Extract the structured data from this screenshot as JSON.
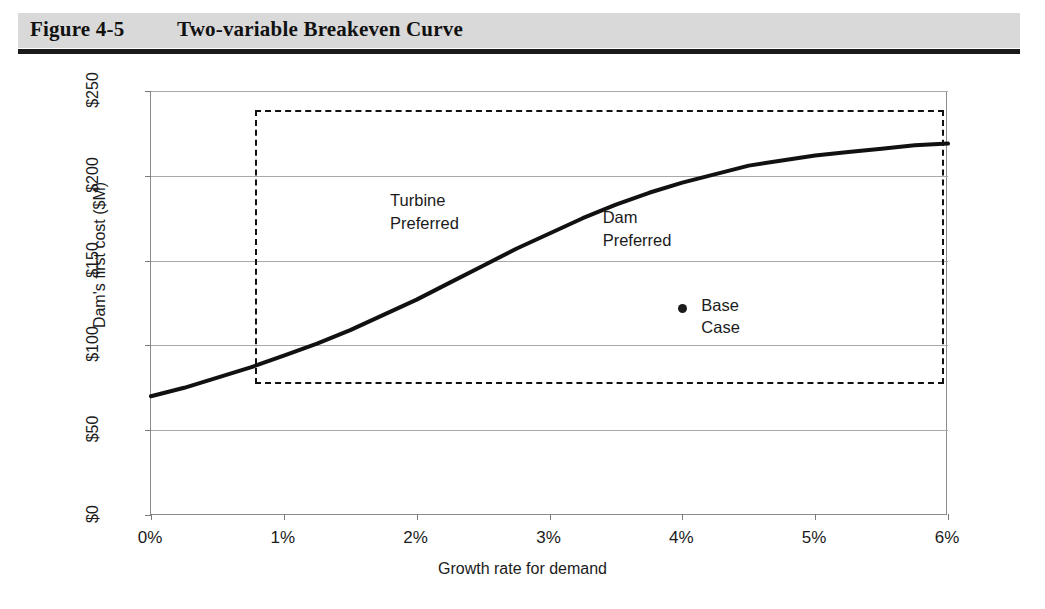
{
  "figure": {
    "number": "Figure 4-5",
    "title": "Two-variable Breakeven Curve",
    "header_bg": "#d9d9d9",
    "rule_color": "#1a1a1a"
  },
  "annotations": {
    "turbine_region": "Turbine\nPreferred",
    "dam_region": "Dam\nPreferred",
    "base_case": "Base\nCase"
  },
  "chart_data": {
    "type": "line",
    "title": "Two-variable Breakeven Curve",
    "xlabel": "Growth rate for demand",
    "ylabel": "Dam's first cost ($M)",
    "xlim": [
      0,
      6
    ],
    "ylim": [
      0,
      250
    ],
    "grid": true,
    "legend": "none",
    "x_ticks": [
      0,
      1,
      2,
      3,
      4,
      5,
      6
    ],
    "x_ticklabels": [
      "0%",
      "1%",
      "2%",
      "3%",
      "4%",
      "5%",
      "6%"
    ],
    "y_ticks": [
      0,
      50,
      100,
      150,
      200,
      250
    ],
    "y_ticklabels": [
      "$0",
      "$50",
      "$100",
      "$150",
      "$200",
      "$250"
    ],
    "series": [
      {
        "name": "Breakeven curve",
        "color": "#111111",
        "linewidth": 4,
        "x": [
          0,
          0.25,
          0.5,
          0.75,
          1.0,
          1.25,
          1.5,
          1.75,
          2.0,
          2.25,
          2.5,
          2.75,
          3.0,
          3.25,
          3.5,
          3.75,
          4.0,
          4.25,
          4.5,
          4.75,
          5.0,
          5.25,
          5.5,
          5.75,
          6.0
        ],
        "y": [
          70,
          75,
          81,
          87,
          94,
          101,
          109,
          118,
          127,
          137,
          147,
          157,
          166,
          175,
          183,
          190,
          196,
          201,
          206,
          209,
          212,
          214,
          216,
          218,
          219
        ]
      }
    ],
    "points": [
      {
        "name": "Base Case",
        "x": 4.0,
        "y": 122,
        "marker": "circle",
        "color": "#1b1b1b",
        "label": "Base\nCase"
      }
    ],
    "regions": [
      {
        "name": "Turbine Preferred",
        "label_x": 1.8,
        "label_y": 192,
        "description": "above/left of the breakeven curve"
      },
      {
        "name": "Dam Preferred",
        "label_x": 3.4,
        "label_y": 182,
        "description": "below/right of the breakeven curve"
      }
    ],
    "shapes": [
      {
        "name": "sensitivity-range-box",
        "type": "rect",
        "style": "dashed",
        "color": "#111111",
        "x0": 0.78,
        "x1": 5.97,
        "y0": 77,
        "y1": 239
      }
    ],
    "annotations": [
      {
        "text": "Turbine Preferred",
        "x": 1.8,
        "y": 192
      },
      {
        "text": "Dam Preferred",
        "x": 3.4,
        "y": 182
      },
      {
        "text": "Base Case",
        "x": 4.15,
        "y": 122
      }
    ]
  }
}
